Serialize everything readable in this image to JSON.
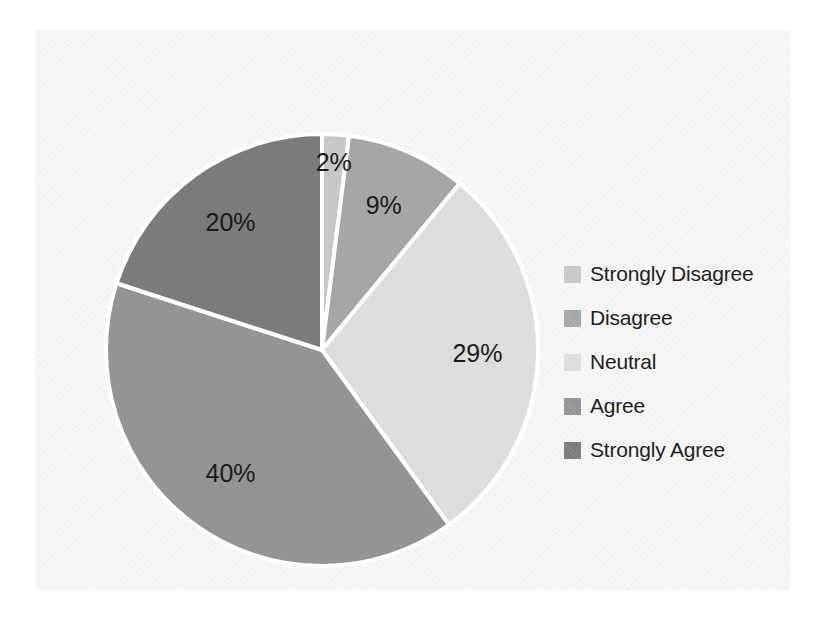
{
  "chart_data": {
    "type": "pie",
    "title": "",
    "categories": [
      "Strongly Disagree",
      "Disagree",
      "Neutral",
      "Agree",
      "Strongly Agree"
    ],
    "values": [
      2,
      9,
      29,
      40,
      20
    ],
    "value_labels": [
      "2%",
      "9%",
      "29%",
      "40%",
      "20%"
    ],
    "unit": "%",
    "start_angle_deg": 0,
    "direction": "clockwise",
    "legend_position": "right",
    "grid": false,
    "colors": [
      "#c7c7c7",
      "#a6a6a6",
      "#dddddd",
      "#949494",
      "#7b7b7b"
    ],
    "slice_separator_color": "#ffffff",
    "label_color": "#1a1a1a",
    "background": "#f7f7f7"
  },
  "legend": {
    "items": [
      {
        "label": "Strongly Disagree",
        "color": "#c7c7c7",
        "swatch_name": "legend-swatch-strongly-disagree"
      },
      {
        "label": "Disagree",
        "color": "#a6a6a6",
        "swatch_name": "legend-swatch-disagree"
      },
      {
        "label": "Neutral",
        "color": "#dddddd",
        "swatch_name": "legend-swatch-neutral"
      },
      {
        "label": "Agree",
        "color": "#949494",
        "swatch_name": "legend-swatch-agree"
      },
      {
        "label": "Strongly Agree",
        "color": "#7b7b7b",
        "swatch_name": "legend-swatch-strongly-agree"
      }
    ]
  },
  "slice_labels": {
    "strongly_disagree": "2%",
    "disagree": "9%",
    "neutral": "29%",
    "agree": "40%",
    "strongly_agree": "20%"
  }
}
